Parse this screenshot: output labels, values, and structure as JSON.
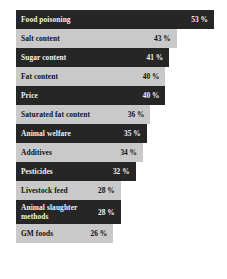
{
  "chart_data": {
    "type": "bar",
    "orientation": "horizontal",
    "title": "",
    "subtitle": "",
    "xlabel": "",
    "ylabel": "",
    "xlim": [
      0,
      53
    ],
    "grid": false,
    "legend": null,
    "value_suffix": "%",
    "categories": [
      "Food poisoning",
      "Salt content",
      "Sugar content",
      "Fat content",
      "Price",
      "Saturated fat content",
      "Animal welfare",
      "Additives",
      "Pesticides",
      "Livestock feed",
      "Animal slaughter methods",
      "GM foods"
    ],
    "values": [
      53,
      43,
      41,
      40,
      40,
      36,
      35,
      34,
      32,
      28,
      28,
      26
    ],
    "value_labels": [
      "53 %",
      "43 %",
      "41 %",
      "40 %",
      "40 %",
      "36 %",
      "35 %",
      "34 %",
      "32 %",
      "28 %",
      "28 %",
      "26 %"
    ],
    "bars": [
      {
        "label": "Food poisoning",
        "value": 53,
        "value_label": "53 %",
        "shade": "dark",
        "two_line": false
      },
      {
        "label": "Salt content",
        "value": 43,
        "value_label": "43 %",
        "shade": "light",
        "two_line": false
      },
      {
        "label": "Sugar content",
        "value": 41,
        "value_label": "41 %",
        "shade": "dark",
        "two_line": false
      },
      {
        "label": "Fat content",
        "value": 40,
        "value_label": "40 %",
        "shade": "light",
        "two_line": false
      },
      {
        "label": "Price",
        "value": 40,
        "value_label": "40 %",
        "shade": "dark",
        "two_line": false
      },
      {
        "label": "Saturated fat content",
        "value": 36,
        "value_label": "36 %",
        "shade": "light",
        "two_line": false
      },
      {
        "label": "Animal welfare",
        "value": 35,
        "value_label": "35 %",
        "shade": "dark",
        "two_line": false
      },
      {
        "label": "Additives",
        "value": 34,
        "value_label": "34 %",
        "shade": "light",
        "two_line": false
      },
      {
        "label": "Pesticides",
        "value": 32,
        "value_label": "32 %",
        "shade": "dark",
        "two_line": false
      },
      {
        "label": "Livestock feed",
        "value": 28,
        "value_label": "28 %",
        "shade": "light",
        "two_line": false
      },
      {
        "label": "Animal slaughter methods",
        "value": 28,
        "value_label": "28 %",
        "shade": "dark",
        "two_line": true
      },
      {
        "label": "GM foods",
        "value": 26,
        "value_label": "26 %",
        "shade": "light",
        "two_line": false
      }
    ],
    "colors": {
      "bar_dark": "#262626",
      "bar_light": "#c9c9c9",
      "text_on_dark": "#f2f2f2",
      "text_on_light": "#111111",
      "background": "#ffffff"
    }
  }
}
